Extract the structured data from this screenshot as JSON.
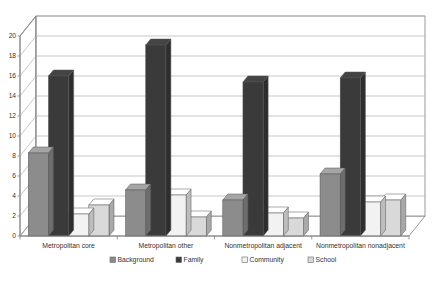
{
  "chart_data": {
    "type": "bar",
    "title": "",
    "subtitle": "",
    "xlabel": "",
    "ylabel": "",
    "ylim": [
      0,
      20
    ],
    "ytick_step": 2,
    "yticks": [
      "0",
      "2",
      "4",
      "6",
      "8",
      "10",
      "12",
      "14",
      "16",
      "18",
      "20"
    ],
    "grid": true,
    "grid_axis": "y",
    "three_d": true,
    "legend_position": "bottom",
    "categories": [
      "Metropolitan core",
      "Metropolitan other",
      "Nonmetropolitan adjacent",
      "Nonmetropolitan nonadjacent"
    ],
    "series": [
      {
        "name": "Background",
        "color": "#8c8c8c",
        "values": [
          8.3,
          4.6,
          3.6,
          6.2
        ]
      },
      {
        "name": "Family",
        "color": "#3a3a3a",
        "values": [
          16.0,
          19.1,
          15.4,
          15.8
        ]
      },
      {
        "name": "Community",
        "color": "#f2f2f2",
        "values": [
          2.2,
          4.1,
          2.3,
          3.4
        ]
      },
      {
        "name": "School",
        "color": "#d9d9d9",
        "values": [
          3.1,
          1.9,
          1.8,
          3.6
        ]
      }
    ]
  },
  "legend": {
    "items": [
      {
        "label": "Background",
        "swatch": "#8c8c8c"
      },
      {
        "label": "Family",
        "swatch": "#3a3a3a"
      },
      {
        "label": "Community",
        "swatch": "#f2f2f2"
      },
      {
        "label": "School",
        "swatch": "#d9d9d9"
      }
    ]
  },
  "axes": {
    "y_tick_labels": [
      "20",
      "18",
      "16",
      "14",
      "12",
      "10",
      "8",
      "6",
      "4",
      "2",
      "0"
    ]
  },
  "colors": {
    "plot_background": "#ffffff",
    "wall_fill": "#ffffff",
    "floor_fill": "#ffffff",
    "gridline": "#b0b0b0",
    "axis_line": "#808080",
    "text": "#333333"
  }
}
